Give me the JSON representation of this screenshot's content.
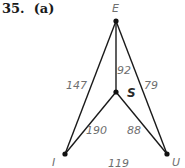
{
  "problem": {
    "number": "35.",
    "part": "(a)",
    "label": "35.  (a)"
  },
  "graph": {
    "vertices": [
      {
        "id": "E",
        "label": "E",
        "x": 116,
        "y": 21
      },
      {
        "id": "S",
        "label": "S",
        "x": 116,
        "y": 92
      },
      {
        "id": "I",
        "label": "I",
        "x": 65,
        "y": 154
      },
      {
        "id": "U",
        "label": "U",
        "x": 167,
        "y": 154
      }
    ],
    "edges": [
      {
        "from": "E",
        "to": "I",
        "weight": "147"
      },
      {
        "from": "E",
        "to": "S",
        "weight": "92"
      },
      {
        "from": "E",
        "to": "U",
        "weight": "79"
      },
      {
        "from": "S",
        "to": "I",
        "weight": "190"
      },
      {
        "from": "S",
        "to": "U",
        "weight": "88"
      },
      {
        "from": "I",
        "to": "U",
        "weight": "119"
      }
    ],
    "colors": {
      "edge": "#1a1a1a",
      "vertex": "#111111",
      "label": "#6f6f6f",
      "iu_edge_start": "#3f7f6f",
      "iu_edge_end": "#9a6f5a"
    }
  }
}
